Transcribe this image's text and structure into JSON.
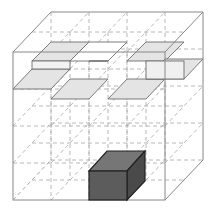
{
  "diagram": {
    "type": "isometric-cube-grid",
    "colors": {
      "background": "#ffffff",
      "frame": "#8a8a8a",
      "grid_dash": "#a0a0a0",
      "slab_fill": "#e3e3e3",
      "slab_edge": "#6e6e6e",
      "cube_front": "#5c5c5c",
      "cube_top": "#707070",
      "cube_side": "#4a4a4a",
      "cube_edge": "#222222"
    },
    "labels": []
  }
}
